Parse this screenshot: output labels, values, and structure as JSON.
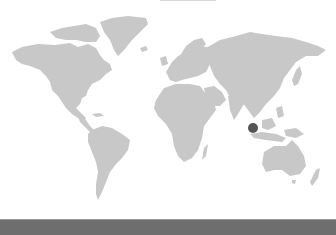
{
  "map": {
    "type": "world-map",
    "land_color": "#c8c8c8",
    "background_color": "#ffffff",
    "marker": {
      "label": "",
      "x": 253,
      "y": 128,
      "radius": 5,
      "color": "#555555",
      "region": "Southeast Asia (Malay Peninsula / Singapore area)"
    }
  },
  "footer_bar": {
    "color": "#6e6e6e"
  }
}
